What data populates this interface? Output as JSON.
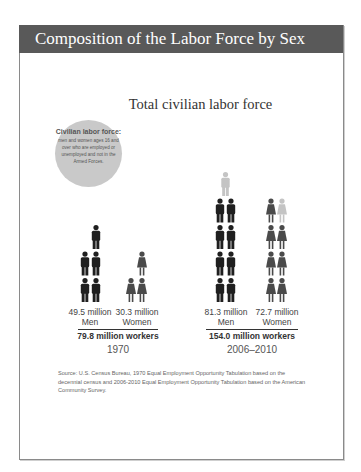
{
  "header": {
    "title": "Composition of the Labor Force by Sex"
  },
  "definition": {
    "title": "Civilian labor force:",
    "body": "men and women ages 16 and over who are employed or unemployed and not in the Armed Forces."
  },
  "source": "Source: U.S. Census Bureau, 1970 Equal Employment Opportunity Tabulation based on the decennial census and 2006-2010 Equal Employment Opportunity Tabulation based on the American Community Survey.",
  "colors": {
    "men": "#1f1f1f",
    "women": "#4a4a4a",
    "partial": "#c4c4c4",
    "header": "#595959"
  },
  "chart_data": {
    "type": "pictograph",
    "title": "Total civilian labor force",
    "unit": "million workers",
    "icon_value": 10,
    "groups": [
      {
        "period": "1970",
        "total_label": "79.8 million workers",
        "total": 79.8,
        "series": [
          {
            "name": "Men",
            "value": 49.5,
            "value_label": "49.5 million",
            "icons": 5,
            "partial_icons": 0
          },
          {
            "name": "Women",
            "value": 30.3,
            "value_label": "30.3 million",
            "icons": 3,
            "partial_icons": 0
          }
        ]
      },
      {
        "period": "2006–2010",
        "total_label": "154.0 million workers",
        "total": 154.0,
        "series": [
          {
            "name": "Men",
            "value": 81.3,
            "value_label": "81.3 million",
            "icons": 8,
            "partial_icons": 1
          },
          {
            "name": "Women",
            "value": 72.7,
            "value_label": "72.7 million",
            "icons": 7,
            "partial_icons": 1
          }
        ]
      }
    ]
  }
}
